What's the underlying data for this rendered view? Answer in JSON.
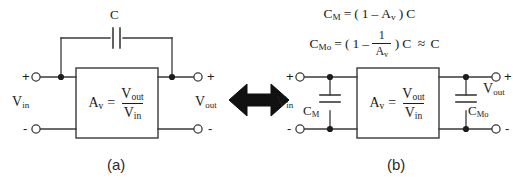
{
  "figure": {
    "kind": "circuit-diagram",
    "background_color": "#ffffff",
    "line_color": "#3a3a3a",
    "text_color": "#1d1d1d",
    "arrow_color": "#111111"
  },
  "panel_a": {
    "caption": "(a)",
    "feedback_cap_label": "C",
    "gain_box": {
      "lhs": "A",
      "lhs_sub": "v",
      "equals": "=",
      "numerator": "V",
      "numerator_sub": "out",
      "denominator": "V",
      "denominator_sub": "in"
    },
    "input_port": {
      "plus": "+",
      "minus": "-",
      "label": "V",
      "label_sub": "in"
    },
    "output_port": {
      "plus": "+",
      "minus": "-",
      "label": "V",
      "label_sub": "out"
    }
  },
  "equivalence_arrow": {
    "name": "double-headed-arrow",
    "direction": "both"
  },
  "panel_b": {
    "caption": "(b)",
    "equations": {
      "line1": {
        "lhs": "C",
        "lhs_sub": "M",
        "equals": "=",
        "open_paren": "(",
        "one": "1",
        "minus": "–",
        "gain": "A",
        "gain_sub": "v",
        "close_paren": ")",
        "cap": "C",
        "plain": "C_M = (1 – A_v)C"
      },
      "line2": {
        "lhs": "C",
        "lhs_sub": "Mo",
        "equals": "=",
        "open_paren": "(",
        "one": "1",
        "minus": "–",
        "frac_num": "1",
        "frac_den": "A",
        "frac_den_sub": "v",
        "close_paren": ")",
        "cap": "C",
        "approx": "≈",
        "approx_cap": "C",
        "plain": "C_Mo = (1 – 1/A_v)C ≈ C"
      }
    },
    "gain_box": {
      "lhs": "A",
      "lhs_sub": "v",
      "equals": "=",
      "numerator": "V",
      "numerator_sub": "out",
      "denominator": "V",
      "denominator_sub": "in"
    },
    "input_cap_label": {
      "base": "C",
      "sub": "M"
    },
    "output_cap_label": {
      "base": "C",
      "sub": "Mo"
    },
    "input_port": {
      "plus": "+",
      "minus": "-",
      "label": "V",
      "label_sub": "in"
    },
    "output_port": {
      "plus": "+",
      "minus": "-",
      "label": "V",
      "label_sub": "out"
    }
  }
}
